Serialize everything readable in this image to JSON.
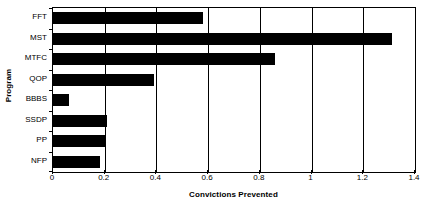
{
  "chart_data": {
    "type": "bar",
    "orientation": "horizontal",
    "title": "",
    "xlabel": "Convictions Prevented",
    "ylabel": "Program",
    "categories": [
      "FFT",
      "MST",
      "MTFC",
      "QOP",
      "BBBS",
      "SSDP",
      "PP",
      "NFP"
    ],
    "values": [
      0.58,
      1.31,
      0.86,
      0.39,
      0.06,
      0.21,
      0.2,
      0.18
    ],
    "xlim": [
      0,
      1.4
    ],
    "xticks": [
      0,
      0.2,
      0.4,
      0.6,
      0.8,
      1,
      1.2,
      1.4
    ],
    "xtick_labels": [
      "0",
      "0.2",
      "0.4",
      "0.6",
      "0.8",
      "1",
      "1.2",
      "1.4"
    ],
    "grid": "vertical",
    "legend": "none",
    "bar_color": "#000000",
    "background_color": "#ffffff",
    "axis_color": "#000000"
  }
}
